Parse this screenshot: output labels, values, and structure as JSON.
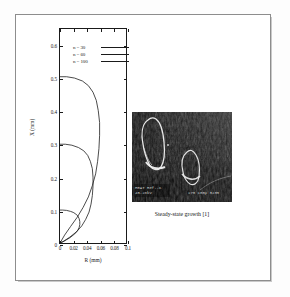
{
  "figure": {
    "caption_photo": "Steady-state growth [1]"
  },
  "chart_data": {
    "type": "line",
    "title": "",
    "xlabel": "R (mm)",
    "ylabel": "X (mm)",
    "xlim": [
      0,
      0.1
    ],
    "ylim": [
      0,
      0.65
    ],
    "xticks": [
      0,
      0.02,
      0.04,
      0.06,
      0.08,
      0.1
    ],
    "xtick_labels": [
      "0",
      "0.02",
      "0.04",
      "0.06",
      "0.08",
      "0.1"
    ],
    "yticks": [
      0,
      0.1,
      0.2,
      0.3,
      0.4,
      0.5,
      0.6
    ],
    "ytick_labels": [
      "0",
      "0.1",
      "0.2",
      "0.3",
      "0.4",
      "0.5",
      "0.6"
    ],
    "grid": false,
    "legend_position": "upper-center",
    "series": [
      {
        "name": "n = 30",
        "label": "n = 30",
        "color": "#1a1a1a",
        "x": [
          0,
          0.004,
          0.01,
          0.016,
          0.02,
          0.024,
          0.027,
          0.029,
          0.03,
          0.03,
          0.029,
          0.027,
          0.024,
          0.02,
          0.015,
          0.009,
          0.004,
          0.0
        ],
        "y": [
          0.1,
          0.1,
          0.099,
          0.096,
          0.093,
          0.088,
          0.082,
          0.074,
          0.065,
          0.056,
          0.047,
          0.039,
          0.031,
          0.024,
          0.016,
          0.009,
          0.003,
          0.0
        ]
      },
      {
        "name": "n = 60",
        "label": "n = 60",
        "color": "#1a1a1a",
        "x": [
          0,
          0.008,
          0.018,
          0.028,
          0.036,
          0.042,
          0.046,
          0.049,
          0.05,
          0.05,
          0.049,
          0.047,
          0.044,
          0.039,
          0.033,
          0.025,
          0.015,
          0.006,
          0.0
        ],
        "y": [
          0.3,
          0.3,
          0.297,
          0.29,
          0.28,
          0.266,
          0.248,
          0.226,
          0.2,
          0.172,
          0.144,
          0.118,
          0.094,
          0.072,
          0.052,
          0.034,
          0.018,
          0.006,
          0.0
        ]
      },
      {
        "name": "n = 100",
        "label": "n = 100",
        "color": "#1a1a1a",
        "x": [
          0,
          0.01,
          0.022,
          0.034,
          0.043,
          0.05,
          0.055,
          0.058,
          0.06,
          0.06,
          0.059,
          0.057,
          0.054,
          0.049,
          0.043,
          0.035,
          0.026,
          0.016,
          0.007,
          0.0
        ],
        "y": [
          0.505,
          0.505,
          0.501,
          0.492,
          0.478,
          0.458,
          0.433,
          0.402,
          0.366,
          0.327,
          0.287,
          0.248,
          0.21,
          0.174,
          0.14,
          0.108,
          0.078,
          0.05,
          0.024,
          0.0
        ]
      }
    ]
  },
  "photo": {
    "name": "sem-micrograph",
    "overlay_text_left": "HEAT Ref.-C",
    "overlay_text_left2": "45-28kV",
    "overlay_text_right": "X70  100µ  3235"
  }
}
